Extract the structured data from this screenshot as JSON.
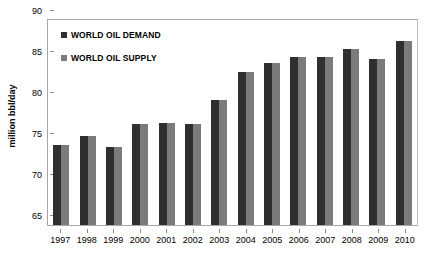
{
  "chart_data": {
    "type": "bar",
    "title": "",
    "subtitle": "",
    "xlabel": "",
    "ylabel": "million bbl/day",
    "categories": [
      "1997",
      "1998",
      "1999",
      "2000",
      "2001",
      "2002",
      "2003",
      "2004",
      "2005",
      "2006",
      "2007",
      "2008",
      "2009",
      "2010"
    ],
    "series": [
      {
        "name": "WORLD OIL DEMAND",
        "color": "#2f2f2f",
        "values": [
          74.8,
          75.9,
          74.5,
          77.3,
          77.4,
          77.3,
          80.2,
          83.6,
          84.8,
          85.5,
          85.5,
          86.5,
          85.2,
          87.4
        ]
      },
      {
        "name": "WORLD OIL SUPPLY",
        "color": "#7b7b7b",
        "values": [
          74.8,
          75.9,
          74.5,
          77.3,
          77.4,
          77.3,
          80.2,
          83.6,
          84.8,
          85.5,
          85.5,
          86.5,
          85.2,
          87.4
        ]
      }
    ],
    "ylim": [
      65,
      90
    ],
    "yticks": [
      90,
      85,
      80,
      75,
      70,
      65
    ],
    "ytick_labels": [
      "90",
      "85",
      "80",
      "75",
      "70",
      "65"
    ],
    "grid": false,
    "legend_position": "top-left",
    "annotations": []
  },
  "legend": {
    "items": [
      {
        "label": "WORLD OIL DEMAND",
        "color": "#2f2f2f"
      },
      {
        "label": "WORLD OIL SUPPLY",
        "color": "#7b7b7b"
      }
    ]
  },
  "colors": {
    "demand": "#2f2f2f",
    "supply": "#7b7b7b",
    "axis": "#a6a6a6",
    "text": "#000000",
    "background": "#ffffff"
  }
}
